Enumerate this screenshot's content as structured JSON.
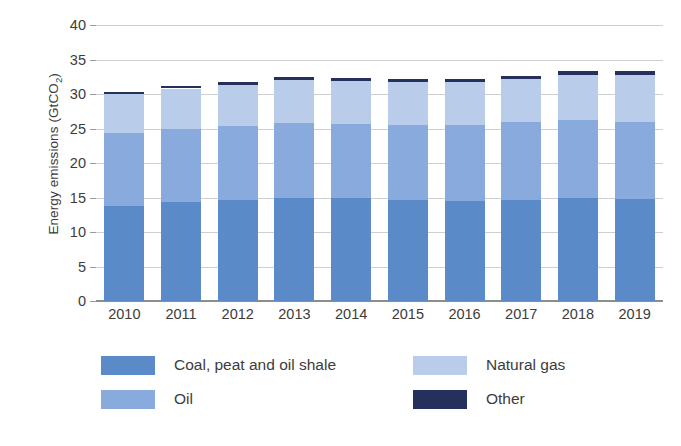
{
  "chart_data": {
    "type": "bar",
    "subtype": "stacked",
    "title": "",
    "xlabel": "",
    "ylabel": "Energy emissions (GtCO2)",
    "ylabel_html": "Energy emissions (GtCO<sub>2</sub>)",
    "categories": [
      "2010",
      "2011",
      "2012",
      "2013",
      "2014",
      "2015",
      "2016",
      "2017",
      "2018",
      "2019"
    ],
    "ylim": [
      0,
      40
    ],
    "yticks": [
      0,
      5,
      10,
      15,
      20,
      25,
      30,
      35,
      40
    ],
    "ytick_labels": [
      "0",
      "5",
      "10",
      "15",
      "20",
      "25",
      "30",
      "35",
      "40"
    ],
    "grid": true,
    "grid_axis": "y",
    "legend_position": "bottom",
    "series": [
      {
        "name": "Coal, peat and oil shale",
        "color": "#5b8ac8",
        "values": [
          13.8,
          14.4,
          14.6,
          15.0,
          15.0,
          14.7,
          14.5,
          14.7,
          14.9,
          14.8
        ]
      },
      {
        "name": "Oil",
        "color": "#89aadd",
        "values": [
          10.6,
          10.5,
          10.8,
          10.8,
          10.7,
          10.8,
          11.0,
          11.2,
          11.4,
          11.2
        ]
      },
      {
        "name": "Natural gas",
        "color": "#b9cdeb",
        "values": [
          5.6,
          5.9,
          5.9,
          6.2,
          6.2,
          6.3,
          6.3,
          6.3,
          6.5,
          6.8
        ]
      },
      {
        "name": "Other",
        "color": "#25305c",
        "values": [
          0.35,
          0.4,
          0.4,
          0.45,
          0.45,
          0.45,
          0.45,
          0.45,
          0.5,
          0.5
        ]
      }
    ],
    "totals": [
      30.35,
      31.2,
      31.7,
      32.45,
      32.35,
      32.25,
      32.25,
      32.65,
      33.3,
      33.3
    ]
  },
  "legend": {
    "items": [
      {
        "label": "Coal, peat and oil shale",
        "color": "#5b8ac8"
      },
      {
        "label": "Natural gas",
        "color": "#b9cdeb"
      },
      {
        "label": "Oil",
        "color": "#89aadd"
      },
      {
        "label": "Other",
        "color": "#25305c"
      }
    ]
  }
}
